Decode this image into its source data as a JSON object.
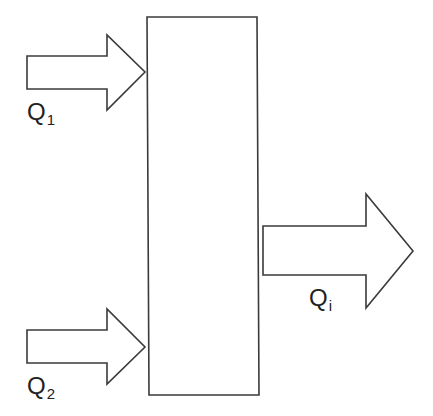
{
  "diagram": {
    "type": "flow-mixing-block",
    "stroke_color": "#3a3a3a",
    "background": "#ffffff",
    "block": {
      "label": ""
    },
    "inputs": [
      {
        "symbol": "Q",
        "subscript": "1",
        "direction": "in"
      },
      {
        "symbol": "Q",
        "subscript": "2",
        "direction": "in"
      }
    ],
    "output": {
      "symbol": "Q",
      "subscript": "i",
      "direction": "out"
    }
  }
}
